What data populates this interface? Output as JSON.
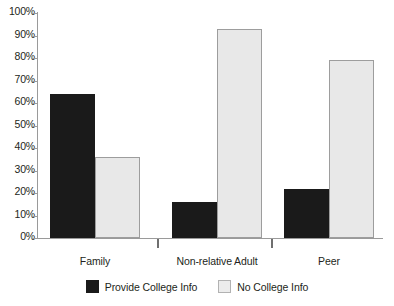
{
  "chart_data": {
    "type": "bar",
    "title": "",
    "xlabel": "",
    "ylabel": "",
    "categories": [
      "Family",
      "Non-relative Adult",
      "Peer"
    ],
    "series": [
      {
        "name": "Provide College Info",
        "color": "#1a1a1a",
        "values": [
          64,
          16,
          22
        ]
      },
      {
        "name": "No College Info",
        "color": "#e8e8e8",
        "values": [
          36,
          93,
          79
        ]
      }
    ],
    "ylim": [
      0,
      100
    ],
    "ytick_values": [
      0,
      10,
      20,
      30,
      40,
      50,
      60,
      70,
      80,
      90,
      100
    ],
    "ytick_labels": [
      "0%",
      "10%",
      "20%",
      "30%",
      "40%",
      "50%",
      "60%",
      "70%",
      "80%",
      "90%",
      "100%"
    ],
    "grid": false,
    "legend_position": "bottom",
    "value_suffix": "%"
  },
  "axis": {
    "y_axis_name": "y-axis",
    "x_axis_name": "x-axis"
  },
  "legend": {
    "items": [
      {
        "label": "Provide College Info",
        "swatch": "dark-swatch"
      },
      {
        "label": "No College Info",
        "swatch": "light-swatch"
      }
    ]
  }
}
